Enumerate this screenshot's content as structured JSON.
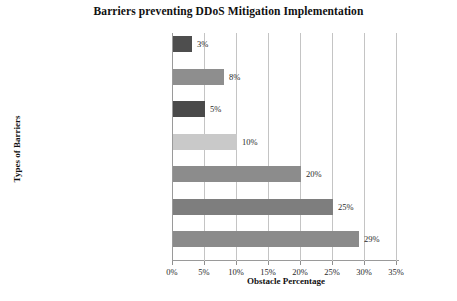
{
  "chart_data": {
    "type": "bar",
    "orientation": "horizontal",
    "title": "Barriers preventing DDoS Mitigation Implementation",
    "xlabel": "Obstacle Percentage",
    "ylabel": "Types of Barriers",
    "xlim": [
      0,
      35
    ],
    "xticks": [
      "0%",
      "5%",
      "10%",
      "15%",
      "20%",
      "25%",
      "30%",
      "35%"
    ],
    "xtick_values": [
      0,
      5,
      10,
      15,
      20,
      25,
      30,
      35
    ],
    "grid": true,
    "legend": "none",
    "categories": [
      "Focus on other Security priorities",
      "Lack of Security Leadership",
      "Insufficient in-house expertise",
      "Inadequate/Legacy Infrastructure",
      "Lack of C-level support",
      "Lack of knowledge and Skills",
      "Insufficient Budget Resources"
    ],
    "values": [
      3,
      8,
      5,
      10,
      20,
      25,
      29
    ],
    "value_labels": [
      "3%",
      "8%",
      "5%",
      "10%",
      "20%",
      "25%",
      "29%"
    ],
    "bar_colors": [
      "#4e4e4e",
      "#8e8e8e",
      "#4a4a4a",
      "#c9c9c9",
      "#8c8c8c",
      "#7e7e7e",
      "#8b8b8b"
    ]
  },
  "colors": {
    "background": "#ffffff",
    "axis": "#9a9a9a",
    "grid": "#c4c4c4",
    "text": "#1a1a1a"
  }
}
